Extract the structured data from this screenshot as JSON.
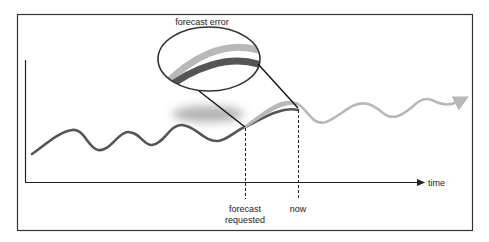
{
  "diagram": {
    "callout_label": "forecast error",
    "x_axis_label": "time",
    "markers": [
      {
        "id": "forecast-requested",
        "label_line1": "forecast",
        "label_line2": "requested"
      },
      {
        "id": "now",
        "label_line1": "now"
      }
    ],
    "series": [
      {
        "name": "actual",
        "color": "#555555"
      },
      {
        "name": "forecast",
        "color": "#b8b8b8"
      }
    ],
    "colors": {
      "frame": "#333333",
      "axis": "#222222",
      "actual_line": "#555555",
      "forecast_line": "#b8b8b8",
      "shadow": "#999999"
    }
  }
}
